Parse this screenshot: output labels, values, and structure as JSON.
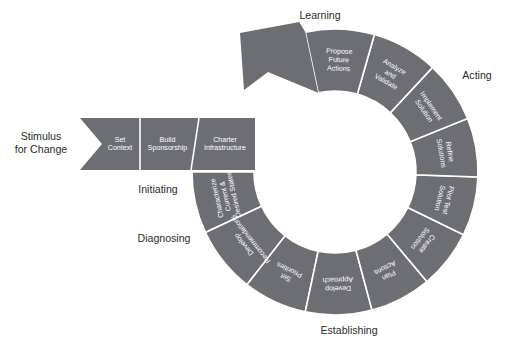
{
  "diagram": {
    "colors": {
      "segment_fill": "#6c6e72",
      "segment_divider": "#ffffff",
      "segment_text": "#ffffff",
      "phase_text": "#2b2b2b",
      "background": "#ffffff"
    },
    "geometry": {
      "center_x": 335,
      "center_y": 172,
      "inner_radius": 81,
      "outer_radius": 143
    },
    "entry": {
      "label_line1": "Stimulus",
      "label_line2": "for Change",
      "banner_steps": [
        {
          "lines": [
            "Set",
            "Context"
          ]
        },
        {
          "lines": [
            "Build",
            "Sponsorship"
          ]
        },
        {
          "lines": [
            "Charter",
            "Infrastructure"
          ]
        }
      ]
    },
    "phases": [
      {
        "name": "Initiating",
        "x": 158,
        "y": 190
      },
      {
        "name": "Diagnosing",
        "x": 164,
        "y": 239
      },
      {
        "name": "Establishing",
        "x": 349,
        "y": 331
      },
      {
        "name": "Acting",
        "x": 477,
        "y": 76
      },
      {
        "name": "Learning",
        "x": 320,
        "y": 16
      }
    ],
    "ring_segments": [
      {
        "lines": [
          "Characterize",
          "Current &",
          "Desired States"
        ],
        "start": 180,
        "end": 205,
        "phase": "Diagnosing"
      },
      {
        "lines": [
          "Develop",
          "Recommendations"
        ],
        "start": 205,
        "end": 232,
        "phase": "Diagnosing"
      },
      {
        "lines": [
          "Set",
          "Priorities"
        ],
        "start": 232,
        "end": 258,
        "phase": "Establishing"
      },
      {
        "lines": [
          "Develop",
          "Approach"
        ],
        "start": 258,
        "end": 285,
        "phase": "Establishing"
      },
      {
        "lines": [
          "Plan",
          "Actions"
        ],
        "start": 285,
        "end": 310,
        "phase": "Establishing"
      },
      {
        "lines": [
          "Create",
          "Solution"
        ],
        "start": 310,
        "end": 334,
        "phase": "Acting"
      },
      {
        "lines": [
          "Pilot Test",
          "Solution"
        ],
        "start": 334,
        "end": 358,
        "phase": "Acting"
      },
      {
        "lines": [
          "Refine",
          "Solutions"
        ],
        "start": 358,
        "end": 382,
        "phase": "Acting"
      },
      {
        "lines": [
          "Implement",
          "Solution"
        ],
        "start": 382,
        "end": 407,
        "phase": "Acting"
      },
      {
        "lines": [
          "Analyze",
          "and",
          "Validate"
        ],
        "start": 407,
        "end": 434,
        "phase": "Learning"
      },
      {
        "lines": [
          "Propose",
          "Future",
          "Actions"
        ],
        "start": 434,
        "end": 462,
        "phase": "Learning"
      }
    ]
  }
}
